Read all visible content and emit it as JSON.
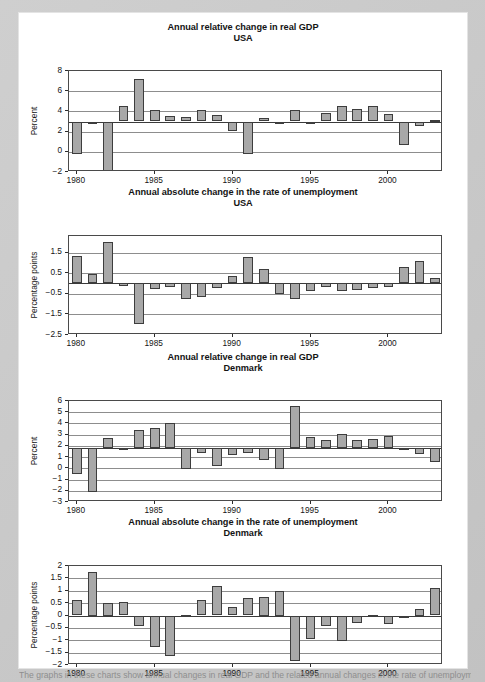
{
  "page": {
    "background_color": "#c9c9c9",
    "paper_color": "#ffffff",
    "bar_fill_color": "#a8a8a8",
    "bar_stroke_color": "#3d3d3d",
    "caption": "The graphs in these charts show annual changes in real GDP and the related annual changes in the rate of unemployment"
  },
  "chart_data": [
    {
      "id": "usa-gdp",
      "type": "bar",
      "title": "Annual relative change in real GDP",
      "subtitle": "USA",
      "ylabel": "Percent",
      "xlabel": "",
      "ylim": [
        -2,
        8
      ],
      "yticks": [
        -2,
        0,
        2,
        4,
        6,
        8
      ],
      "ytick_labels": [
        "−2",
        "0",
        "2",
        "4",
        "6",
        "8"
      ],
      "xticks": [
        1980,
        1985,
        1990,
        1995,
        2000
      ],
      "grid": true,
      "baseline": 3.0,
      "baseline_note": "bars drawn from the period mean (~3.0), not from zero",
      "categories": [
        1980,
        1981,
        1982,
        1983,
        1984,
        1985,
        1986,
        1987,
        1988,
        1989,
        1990,
        1991,
        1992,
        1993,
        1994,
        1995,
        1996,
        1997,
        1998,
        1999,
        2000,
        2001,
        2002,
        2003
      ],
      "values": [
        -0.2,
        2.8,
        -2.0,
        4.5,
        7.2,
        4.1,
        3.5,
        3.4,
        4.1,
        3.6,
        2.1,
        -0.2,
        3.3,
        2.9,
        4.1,
        2.9,
        3.8,
        4.5,
        4.2,
        4.5,
        3.7,
        0.7,
        2.6,
        3.1
      ]
    },
    {
      "id": "usa-unemployment",
      "type": "bar",
      "title": "Annual absolute change in the rate of unemployment",
      "subtitle": "USA",
      "ylabel": "Percentage points",
      "xlabel": "",
      "ylim": [
        -2.5,
        2.3
      ],
      "yticks": [
        -2.5,
        -1.5,
        -0.5,
        0.5,
        1.5
      ],
      "ytick_labels": [
        "−2.5",
        "−1.5",
        "−0.5",
        "0.5",
        "1.5"
      ],
      "xticks": [
        1980,
        1985,
        1990,
        1995,
        2000
      ],
      "grid": true,
      "baseline": 0,
      "categories": [
        1980,
        1981,
        1982,
        1983,
        1984,
        1985,
        1986,
        1987,
        1988,
        1989,
        1990,
        1991,
        1992,
        1993,
        1994,
        1995,
        1996,
        1997,
        1998,
        1999,
        2000,
        2001,
        2002,
        2003
      ],
      "values": [
        1.35,
        0.45,
        2.0,
        -0.1,
        -1.95,
        -0.25,
        -0.15,
        -0.75,
        -0.65,
        -0.2,
        0.35,
        1.3,
        0.7,
        -0.5,
        -0.75,
        -0.35,
        -0.15,
        -0.35,
        -0.3,
        -0.2,
        -0.15,
        0.8,
        1.1,
        0.25
      ]
    },
    {
      "id": "denmark-gdp",
      "type": "bar",
      "title": "Annual relative change in real GDP",
      "subtitle": "Denmark",
      "ylabel": "Percent",
      "xlabel": "",
      "ylim": [
        -3,
        6
      ],
      "yticks": [
        -3,
        -2,
        -1,
        0,
        1,
        2,
        3,
        4,
        5,
        6
      ],
      "ytick_labels": [
        "−3",
        "−2",
        "−1",
        "0",
        "1",
        "2",
        "3",
        "4",
        "5",
        "6"
      ],
      "xticks": [
        1980,
        1985,
        1990,
        1995,
        2000
      ],
      "grid": true,
      "baseline": 1.8,
      "baseline_note": "bars drawn from the period mean (~1.8), not from zero",
      "categories": [
        1980,
        1981,
        1982,
        1983,
        1984,
        1985,
        1986,
        1987,
        1988,
        1989,
        1990,
        1991,
        1992,
        1993,
        1994,
        1995,
        1996,
        1997,
        1998,
        1999,
        2000,
        2001,
        2002,
        2003
      ],
      "values": [
        -0.55,
        -2.1,
        2.7,
        1.85,
        3.45,
        3.6,
        4.0,
        -0.05,
        1.4,
        0.25,
        1.2,
        1.35,
        0.75,
        -0.05,
        5.55,
        2.8,
        2.55,
        3.05,
        2.5,
        2.65,
        2.85,
        1.65,
        1.3,
        0.6
      ]
    },
    {
      "id": "denmark-unemployment",
      "type": "bar",
      "title": "Annual absolute change in the rate of unemployment",
      "subtitle": "Denmark",
      "ylabel": "Percentage points",
      "xlabel": "",
      "ylim": [
        -2,
        2
      ],
      "yticks": [
        -2,
        -1.5,
        -1,
        -0.5,
        0,
        0.5,
        1,
        1.5,
        2
      ],
      "ytick_labels": [
        "−2",
        "−1.5",
        "−1",
        "−0.5",
        "0",
        "0.5",
        "1",
        "1.5",
        "2"
      ],
      "xticks": [
        1980,
        1985,
        1990,
        1995,
        2000
      ],
      "grid": true,
      "baseline": 0,
      "categories": [
        1980,
        1981,
        1982,
        1983,
        1984,
        1985,
        1986,
        1987,
        1988,
        1989,
        1990,
        1991,
        1992,
        1993,
        1994,
        1995,
        1996,
        1997,
        1998,
        1999,
        2000,
        2001,
        2002,
        2003
      ],
      "values": [
        0.63,
        1.75,
        0.5,
        0.55,
        -0.42,
        -1.27,
        -1.62,
        0.02,
        0.63,
        1.2,
        0.35,
        0.72,
        0.75,
        1.0,
        -1.83,
        -0.95,
        -0.42,
        -1.05,
        -0.3,
        0.03,
        -0.35,
        -0.03,
        0.25,
        1.12
      ]
    }
  ]
}
